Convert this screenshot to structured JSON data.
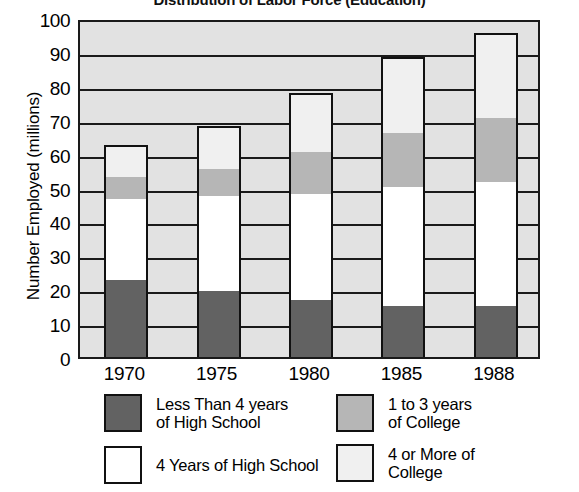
{
  "chart_data": {
    "type": "bar",
    "subtype": "stacked",
    "title": "Distribution of Labor Force (Education)",
    "xlabel": "",
    "ylabel": "Number Employed (millions)",
    "ylim": [
      0,
      100
    ],
    "ytick_step": 10,
    "yticks": [
      100,
      90,
      80,
      70,
      60,
      50,
      40,
      30,
      20,
      10,
      0
    ],
    "grid": true,
    "legend_position": "bottom",
    "categories": [
      "1970",
      "1975",
      "1980",
      "1985",
      "1988"
    ],
    "series": [
      {
        "name": "Less Than 4 years of High School",
        "color": "#626262",
        "values": [
          23,
          19.5,
          17,
          15,
          15
        ]
      },
      {
        "name": "4 Years of High School",
        "color": "#ffffff",
        "values": [
          24,
          28.5,
          31.5,
          35.5,
          37
        ]
      },
      {
        "name": "1 to 3 years of College",
        "color": "#b6b6b6",
        "values": [
          6.5,
          8,
          12.5,
          16,
          19
        ]
      },
      {
        "name": "4 or More of College",
        "color": "#f0f0f0",
        "values": [
          9,
          12,
          17,
          22,
          24.5
        ]
      }
    ],
    "cumulative_tops": [
      [
        23,
        47,
        53.5,
        62.5
      ],
      [
        19.5,
        48,
        56,
        68
      ],
      [
        17,
        48.5,
        61,
        78
      ],
      [
        15,
        50.5,
        66.5,
        88.5
      ],
      [
        15,
        52,
        71,
        95.5
      ]
    ],
    "totals": [
      62.5,
      68,
      78,
      88.5,
      95.5
    ]
  },
  "axes": {
    "y_title": "Number Employed (millions)",
    "y_tick_labels": [
      "100",
      "90",
      "80",
      "70",
      "60",
      "50",
      "40",
      "30",
      "20",
      "10",
      "0"
    ],
    "x_tick_labels": [
      "1970",
      "1975",
      "1980",
      "1985",
      "1988"
    ]
  },
  "legend": {
    "items": [
      {
        "label": "Less Than 4 years\nof High School",
        "swatch": "#626262"
      },
      {
        "label": "1 to 3 years\nof College",
        "swatch": "#b6b6b6"
      },
      {
        "label": "4 Years of High School",
        "swatch": "#ffffff"
      },
      {
        "label": "4 or More of\nCollege",
        "swatch": "#f0f0f0"
      }
    ]
  },
  "colors": {
    "plot_background": "#e2e2e2",
    "gridline": "#1a1a1a",
    "frame": "#1a1a1a",
    "text": "#000000"
  }
}
